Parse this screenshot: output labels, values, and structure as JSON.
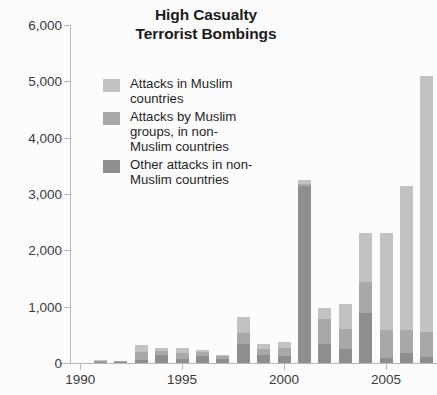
{
  "chart_data": {
    "type": "bar",
    "subtype": "stacked-bar",
    "title": "High Casualty Terrorist Bombings",
    "title_lines": [
      "High Casualty",
      "Terrorist Bombings"
    ],
    "xlabel": "",
    "ylabel": "",
    "grid": false,
    "legend_position": "inside-top-left",
    "ylim": [
      0,
      6000
    ],
    "yticks": [
      0,
      1000,
      2000,
      3000,
      4000,
      5000,
      6000
    ],
    "ytick_labels": [
      "0",
      "1,000",
      "2,000",
      "3,000",
      "4,000",
      "5,000",
      "6,000"
    ],
    "xlim": [
      1989.5,
      2007.5
    ],
    "xticks": [
      1990,
      1995,
      2000,
      2005
    ],
    "xtick_labels": [
      "1990",
      "1995",
      "2000",
      "2005"
    ],
    "categories": [
      "1990",
      "1991",
      "1992",
      "1993",
      "1994",
      "1995",
      "1996",
      "1997",
      "1998",
      "1999",
      "2000",
      "2001",
      "2002",
      "2003",
      "2004",
      "2005",
      "2006",
      "2007"
    ],
    "stack_order_bottom_to_top": [
      "Other attacks in non-Muslim countries",
      "Attacks by Muslim groups, in non-Muslim countries",
      "Attacks in Muslim countries"
    ],
    "series": [
      {
        "name": "Other attacks in non-Muslim countries",
        "color": "#8e8e8e",
        "values": [
          0,
          20,
          15,
          60,
          140,
          80,
          130,
          80,
          330,
          150,
          130,
          3150,
          330,
          250,
          880,
          90,
          180,
          110
        ]
      },
      {
        "name": "Attacks by Muslim groups, in non-Muslim countries",
        "color": "#a8a8a8",
        "values": [
          0,
          10,
          5,
          130,
          70,
          90,
          60,
          50,
          200,
          100,
          140,
          30,
          450,
          350,
          560,
          490,
          400,
          440
        ]
      },
      {
        "name": "Attacks in Muslim countries",
        "color": "#c2c2c2",
        "values": [
          0,
          10,
          5,
          130,
          50,
          90,
          40,
          20,
          280,
          90,
          110,
          70,
          200,
          440,
          860,
          1720,
          2570,
          4550
        ]
      }
    ],
    "totals": [
      0,
      40,
      25,
      320,
      260,
      260,
      230,
      150,
      810,
      340,
      380,
      3250,
      980,
      1040,
      2300,
      2300,
      3150,
      5100
    ]
  },
  "legend": {
    "items": [
      {
        "label_lines": [
          "Attacks in Muslim",
          "countries"
        ],
        "color": "#c2c2c2",
        "swatch_name": "legend-swatch-attacks-in-muslim-countries"
      },
      {
        "label_lines": [
          "Attacks by Muslim",
          "groups, in non-",
          "Muslim countries"
        ],
        "color": "#a8a8a8",
        "swatch_name": "legend-swatch-attacks-by-muslim-groups"
      },
      {
        "label_lines": [
          "Other attacks in non-",
          "Muslim countries"
        ],
        "color": "#8e8e8e",
        "swatch_name": "legend-swatch-other-attacks"
      }
    ]
  },
  "colors": {
    "background": "#fcfcfc",
    "axis": "#b9b9b9",
    "title_text": "#1b1b1b",
    "tick_text": "#3a3a3a",
    "series_light": "#c2c2c2",
    "series_medium": "#a8a8a8",
    "series_dark": "#8e8e8e"
  }
}
